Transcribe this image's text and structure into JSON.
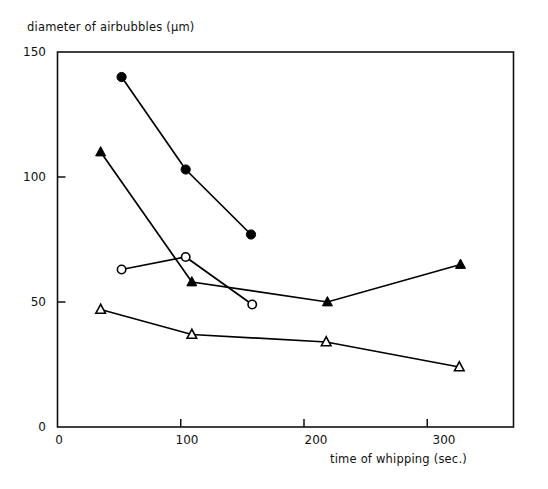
{
  "chart_data": {
    "type": "line",
    "title": "",
    "xlabel": "time of whipping (sec.)",
    "ylabel": "diameter of airbubbles (µm)",
    "xlim": [
      0,
      370
    ],
    "ylim": [
      0,
      150
    ],
    "xticks": [
      0,
      100,
      200,
      300
    ],
    "xtick_labels": [
      "0",
      "100",
      "200",
      "300"
    ],
    "yticks": [
      0,
      50,
      100,
      150
    ],
    "ytick_labels": [
      "0",
      "50",
      "100",
      "150"
    ],
    "grid": false,
    "legend": "none",
    "series": [
      {
        "name": "filled-circle-series",
        "marker": "filled-circle",
        "color": "#000000",
        "x": [
          52,
          104,
          157
        ],
        "y": [
          140,
          103,
          77
        ]
      },
      {
        "name": "filled-triangle-series",
        "marker": "filled-triangle",
        "color": "#000000",
        "x": [
          35,
          109,
          219,
          327
        ],
        "y": [
          110,
          58,
          50,
          65
        ]
      },
      {
        "name": "open-circle-series",
        "marker": "open-circle",
        "color": "#000000",
        "x": [
          52,
          104,
          158
        ],
        "y": [
          63,
          68,
          49
        ]
      },
      {
        "name": "open-triangle-series",
        "marker": "open-triangle",
        "color": "#000000",
        "x": [
          35,
          109,
          218,
          326
        ],
        "y": [
          47,
          37,
          34,
          24
        ]
      }
    ]
  },
  "axes": {
    "frame_color": "#111111",
    "x_tick_label_0": "0",
    "x_tick_label_100": "100",
    "x_tick_label_200": "200",
    "x_tick_label_300": "300",
    "y_tick_label_0": "0",
    "y_tick_label_50": "50",
    "y_tick_label_100": "100",
    "y_tick_label_150": "150",
    "x_axis_title": "time of whipping (sec.)",
    "y_axis_title": "diameter of airbubbles (µm)"
  }
}
